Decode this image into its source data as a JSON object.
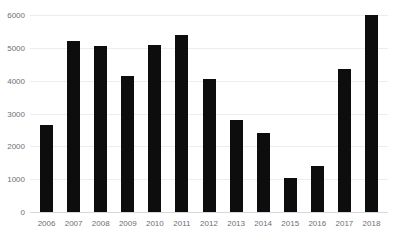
{
  "chart_data": {
    "type": "bar",
    "title": "",
    "xlabel": "",
    "ylabel": "",
    "categories": [
      "2006",
      "2007",
      "2008",
      "2009",
      "2010",
      "2011",
      "2012",
      "2013",
      "2014",
      "2015",
      "2016",
      "2017",
      "2018"
    ],
    "values": [
      2650,
      5200,
      5050,
      4150,
      5100,
      5400,
      4050,
      2800,
      2400,
      1050,
      1400,
      4350,
      6000
    ],
    "ylim": [
      0,
      6000
    ],
    "yticks": [
      0,
      1000,
      2000,
      3000,
      4000,
      5000,
      6000
    ],
    "ytick_labels": [
      "0",
      "1000",
      "2000",
      "3000",
      "4000",
      "5000",
      "6000"
    ],
    "grid": true,
    "legend": false,
    "legend_position": "none",
    "bar_color": "#0d0d0d",
    "gridline_color": "#ededf0",
    "axis_text_color": "#6e6e78",
    "background_color": "#ffffff"
  }
}
